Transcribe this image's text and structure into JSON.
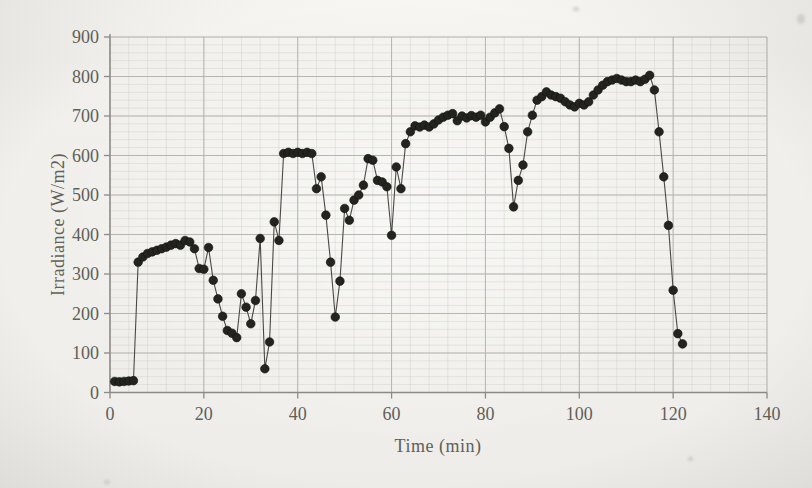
{
  "figure": {
    "xlabel": "Time (min)",
    "ylabel": "Irradiance (W/m2)"
  },
  "colors": {
    "paper": "#f1f0ec",
    "grid_minor": "#ccccc6",
    "grid_major": "#b6b5af",
    "axis": "#8b8a84",
    "tick_text": "#605f58",
    "marker_fill": "#23231f",
    "line": "#4a4944"
  },
  "chart_data": {
    "type": "line",
    "title": "",
    "xlabel": "Time (min)",
    "ylabel": "Irradiance (W/m2)",
    "xlim": [
      0,
      140
    ],
    "ylim": [
      0,
      900
    ],
    "x_ticks": [
      0,
      20,
      40,
      60,
      80,
      100,
      120,
      140
    ],
    "y_ticks": [
      0,
      100,
      200,
      300,
      400,
      500,
      600,
      700,
      800,
      900
    ],
    "x_minor_step": 4,
    "y_minor_step": 20,
    "grid": true,
    "legend": "none",
    "marker": "filled-circle",
    "series": [
      {
        "name": "irradiance",
        "points": [
          [
            1,
            28
          ],
          [
            2,
            27
          ],
          [
            3,
            28
          ],
          [
            4,
            29
          ],
          [
            5,
            30
          ],
          [
            6,
            330
          ],
          [
            7,
            343
          ],
          [
            8,
            352
          ],
          [
            9,
            356
          ],
          [
            10,
            360
          ],
          [
            11,
            364
          ],
          [
            12,
            368
          ],
          [
            13,
            373
          ],
          [
            14,
            377
          ],
          [
            15,
            373
          ],
          [
            16,
            385
          ],
          [
            17,
            381
          ],
          [
            18,
            364
          ],
          [
            19,
            314
          ],
          [
            20,
            312
          ],
          [
            21,
            367
          ],
          [
            22,
            284
          ],
          [
            23,
            237
          ],
          [
            24,
            193
          ],
          [
            25,
            157
          ],
          [
            26,
            150
          ],
          [
            27,
            139
          ],
          [
            28,
            250
          ],
          [
            29,
            216
          ],
          [
            30,
            174
          ],
          [
            31,
            233
          ],
          [
            32,
            390
          ],
          [
            33,
            60
          ],
          [
            34,
            128
          ],
          [
            35,
            432
          ],
          [
            36,
            385
          ],
          [
            37,
            605
          ],
          [
            38,
            608
          ],
          [
            39,
            605
          ],
          [
            40,
            608
          ],
          [
            41,
            605
          ],
          [
            42,
            608
          ],
          [
            43,
            605
          ],
          [
            44,
            516
          ],
          [
            45,
            546
          ],
          [
            46,
            449
          ],
          [
            47,
            330
          ],
          [
            48,
            191
          ],
          [
            49,
            282
          ],
          [
            50,
            466
          ],
          [
            51,
            436
          ],
          [
            52,
            487
          ],
          [
            53,
            500
          ],
          [
            54,
            525
          ],
          [
            55,
            592
          ],
          [
            56,
            588
          ],
          [
            57,
            537
          ],
          [
            58,
            533
          ],
          [
            59,
            521
          ],
          [
            60,
            398
          ],
          [
            61,
            571
          ],
          [
            62,
            516
          ],
          [
            63,
            630
          ],
          [
            64,
            660
          ],
          [
            65,
            675
          ],
          [
            66,
            672
          ],
          [
            67,
            677
          ],
          [
            68,
            672
          ],
          [
            69,
            680
          ],
          [
            70,
            690
          ],
          [
            71,
            697
          ],
          [
            72,
            702
          ],
          [
            73,
            706
          ],
          [
            74,
            688
          ],
          [
            75,
            700
          ],
          [
            76,
            695
          ],
          [
            77,
            701
          ],
          [
            78,
            697
          ],
          [
            79,
            702
          ],
          [
            80,
            685
          ],
          [
            81,
            697
          ],
          [
            82,
            708
          ],
          [
            83,
            718
          ],
          [
            84,
            673
          ],
          [
            85,
            618
          ],
          [
            86,
            470
          ],
          [
            87,
            537
          ],
          [
            88,
            576
          ],
          [
            89,
            660
          ],
          [
            90,
            702
          ],
          [
            91,
            740
          ],
          [
            92,
            749
          ],
          [
            93,
            761
          ],
          [
            94,
            753
          ],
          [
            95,
            749
          ],
          [
            96,
            745
          ],
          [
            97,
            736
          ],
          [
            98,
            728
          ],
          [
            99,
            723
          ],
          [
            100,
            732
          ],
          [
            101,
            728
          ],
          [
            102,
            736
          ],
          [
            103,
            753
          ],
          [
            104,
            766
          ],
          [
            105,
            778
          ],
          [
            106,
            787
          ],
          [
            107,
            791
          ],
          [
            108,
            795
          ],
          [
            109,
            791
          ],
          [
            110,
            787
          ],
          [
            111,
            787
          ],
          [
            112,
            791
          ],
          [
            113,
            787
          ],
          [
            114,
            793
          ],
          [
            115,
            803
          ],
          [
            116,
            766
          ],
          [
            117,
            660
          ],
          [
            118,
            546
          ],
          [
            119,
            423
          ],
          [
            120,
            259
          ],
          [
            121,
            149
          ],
          [
            122,
            123
          ]
        ]
      }
    ]
  }
}
